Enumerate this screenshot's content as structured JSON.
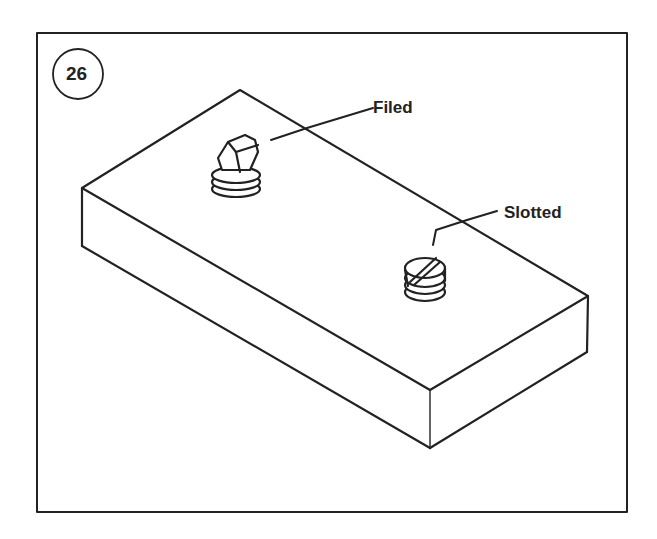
{
  "figure": {
    "number": "26",
    "labels": {
      "filed": "Filed",
      "slotted": "Slotted"
    },
    "colors": {
      "ink": "#222222",
      "background": "#ffffff"
    }
  }
}
